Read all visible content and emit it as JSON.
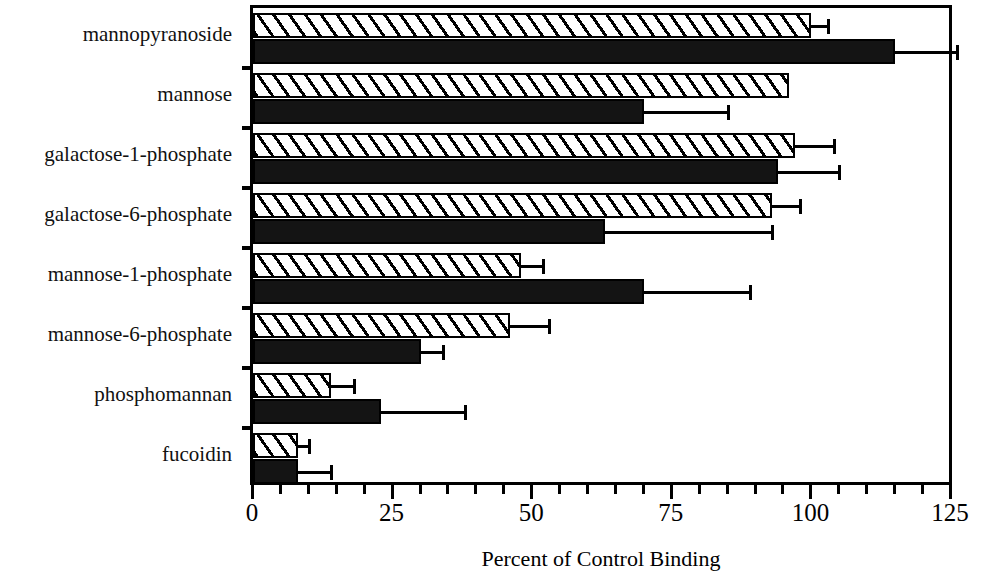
{
  "chart_data": {
    "type": "bar",
    "orientation": "horizontal",
    "title": "",
    "xlabel": "Percent of Control Binding",
    "ylabel": "",
    "xlim": [
      0,
      125
    ],
    "xticks": [
      0,
      25,
      50,
      75,
      100,
      125
    ],
    "xtick_labels": [
      "0",
      "25",
      "50",
      "75",
      "100",
      "125"
    ],
    "minor_tick_interval": 5,
    "grid": false,
    "legend": "none",
    "categories": [
      "mannopyranoside",
      "mannose",
      "galactose-1-phosphate",
      "galactose-6-phosphate",
      "mannose-1-phosphate",
      "mannose-6-phosphate",
      "phosphomannan",
      "fucoidin"
    ],
    "series": [
      {
        "name": "hatched",
        "pattern": "diagonal-hatch",
        "fill": "#ffffff",
        "values": [
          100,
          96,
          97,
          93,
          48,
          46,
          14,
          8
        ],
        "errors": [
          3,
          0,
          7,
          5,
          4,
          7,
          4,
          2
        ]
      },
      {
        "name": "solid",
        "pattern": "solid",
        "fill": "#141414",
        "values": [
          115,
          70,
          94,
          63,
          70,
          30,
          23,
          8
        ],
        "errors": [
          11,
          15,
          11,
          30,
          19,
          4,
          15,
          6
        ]
      }
    ]
  },
  "axis": {
    "xlabel": "Percent of Control Binding"
  }
}
